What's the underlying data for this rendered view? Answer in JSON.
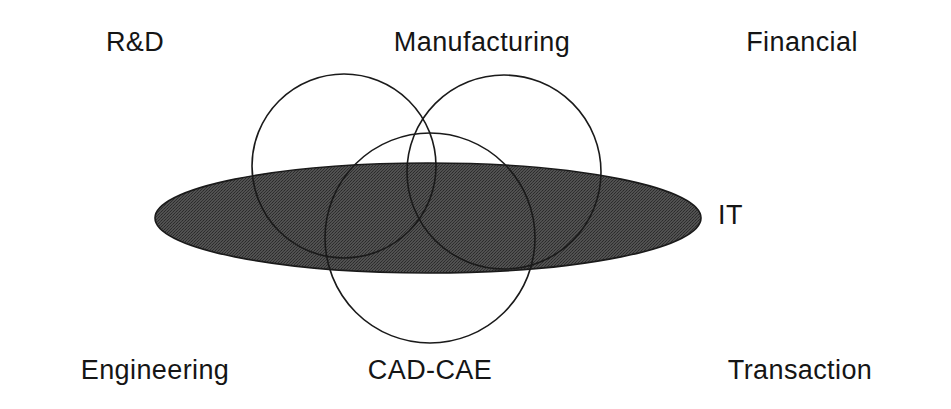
{
  "diagram": {
    "type": "venn-overlap-diagram",
    "title_text": "",
    "background_color": "#ffffff",
    "labels": [
      {
        "id": "rnd",
        "text": "R&D",
        "x": 135,
        "y": 29,
        "align": "center"
      },
      {
        "id": "manufacturing",
        "text": "Manufacturing",
        "x": 482,
        "y": 29,
        "align": "center"
      },
      {
        "id": "financial",
        "text": "Financial",
        "x": 802,
        "y": 29,
        "align": "center"
      },
      {
        "id": "it",
        "text": "IT",
        "x": 718,
        "y": 202,
        "align": "left"
      },
      {
        "id": "engineering",
        "text": "Engineering",
        "x": 155,
        "y": 357,
        "align": "center"
      },
      {
        "id": "cad-cae",
        "text": "CAD-CAE",
        "x": 430,
        "y": 357,
        "align": "center"
      },
      {
        "id": "transaction",
        "text": "Transaction",
        "x": 800,
        "y": 357,
        "align": "center"
      }
    ],
    "ellipse": {
      "id": "it-ellipse",
      "label_ref": "it",
      "cx": 428,
      "cy": 218,
      "rx": 273,
      "ry": 55,
      "fill_color": "#4d4d4d",
      "stroke_color": "#1a1a1a",
      "stroke_width": 1.6
    },
    "circles": [
      {
        "id": "rnd-engineering-circle",
        "label_refs": [
          "rnd",
          "engineering"
        ],
        "cx": 344,
        "cy": 166,
        "r": 92,
        "fill": "none",
        "stroke_color": "#1a1a1a",
        "stroke_width": 1.6
      },
      {
        "id": "manufacturing-financial-circle",
        "label_refs": [
          "manufacturing",
          "financial"
        ],
        "cx": 504,
        "cy": 172,
        "r": 97,
        "fill": "none",
        "stroke_color": "#1a1a1a",
        "stroke_width": 1.6
      },
      {
        "id": "cad-cae-circle",
        "label_refs": [
          "cad-cae"
        ],
        "cx": 430,
        "cy": 238,
        "r": 105,
        "fill": "none",
        "stroke_color": "#1a1a1a",
        "stroke_width": 1.6
      }
    ]
  }
}
